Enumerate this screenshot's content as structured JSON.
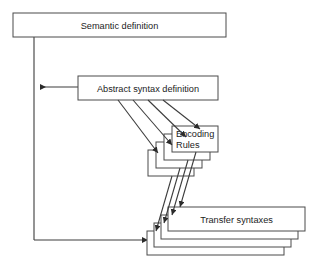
{
  "diagram": {
    "background_color": "#ffffff",
    "line_color": "#3c3c3c",
    "box_fill": "#ffffff",
    "box_stroke": "#4a4a4a",
    "text_color": "#1c1c1c",
    "nodes": {
      "semantic_definition": {
        "label": "Semantic definition",
        "x": 13,
        "y": 13,
        "width": 213,
        "height": 24
      },
      "abstract_syntax_definition": {
        "label": "Abstract syntax definition",
        "x": 78,
        "y": 76,
        "width": 140,
        "height": 24
      },
      "encoding_rules": {
        "label_line1": "Encoding",
        "label_line2": "Rules",
        "stack_count": 4,
        "front_x": 172,
        "front_y": 126,
        "width": 46,
        "height": 26,
        "offset_x": -8,
        "offset_y": 8
      },
      "transfer_syntaxes": {
        "label": "Transfer syntaxes",
        "stack_count": 4,
        "front_x": 168,
        "front_y": 207,
        "width": 137,
        "height": 24,
        "offset_x": -7,
        "offset_y": 8
      }
    },
    "edges": [
      {
        "name": "abstract-to-semantic",
        "from": "abstract_syntax_definition",
        "to": "semantic_definition",
        "style": "orthogonal",
        "arrow": "left"
      },
      {
        "name": "semantic-to-transfer",
        "from": "semantic_definition",
        "to": "transfer_syntaxes",
        "style": "orthogonal",
        "arrow": "right"
      },
      {
        "name": "abstract-to-encoding",
        "from": "abstract_syntax_definition",
        "to": "encoding_rules",
        "style": "diagonal-bundle",
        "count": 4
      },
      {
        "name": "encoding-to-transfer",
        "from": "encoding_rules",
        "to": "transfer_syntaxes",
        "style": "diagonal-bundle",
        "count": 4
      }
    ],
    "spine": {
      "x": 34,
      "top_y": 37,
      "bottom_y": 240
    }
  }
}
